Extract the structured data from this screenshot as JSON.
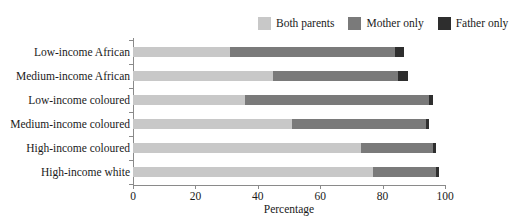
{
  "chart_data": {
    "type": "bar",
    "orientation": "horizontal",
    "stacked": true,
    "title": "",
    "xlabel": "Percentage",
    "ylabel": "",
    "xlim": [
      0,
      100
    ],
    "xticks": [
      0,
      20,
      40,
      60,
      80,
      100
    ],
    "grid": false,
    "legend_position": "top-right",
    "categories": [
      "Low-income African",
      "Medium-income African",
      "Low-income coloured",
      "Medium-income coloured",
      "High-income coloured",
      "High-income white"
    ],
    "series": [
      {
        "name": "Both parents",
        "color": "#c8c8c8",
        "values": [
          31,
          45,
          36,
          51,
          73,
          77
        ]
      },
      {
        "name": "Mother only",
        "color": "#7a7a7a",
        "values": [
          53,
          40,
          59,
          43,
          23,
          20
        ]
      },
      {
        "name": "Father only",
        "color": "#2e2e2e",
        "values": [
          3,
          3,
          1,
          1,
          1,
          1
        ]
      }
    ],
    "totals": [
      87,
      88,
      96,
      95,
      97,
      98
    ]
  },
  "legend": {
    "items": [
      {
        "label": "Both parents",
        "color": "#c8c8c8"
      },
      {
        "label": "Mother only",
        "color": "#7a7a7a"
      },
      {
        "label": "Father only",
        "color": "#2e2e2e"
      }
    ]
  },
  "axis": {
    "x_title": "Percentage",
    "x_tick_labels": [
      "0",
      "20",
      "40",
      "60",
      "80",
      "100"
    ]
  }
}
